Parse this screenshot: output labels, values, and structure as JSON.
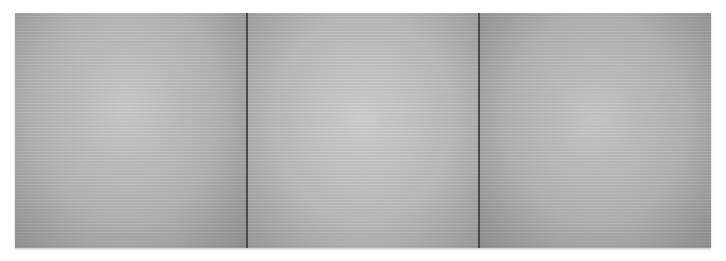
{
  "artwork": {
    "panel_count": 3,
    "panels": [
      {
        "color": "#b3b3b3"
      },
      {
        "color": "#bababa"
      },
      {
        "color": "#b2b2b2"
      }
    ],
    "divider_color": "#4a4a4a",
    "background": "#ffffff"
  }
}
